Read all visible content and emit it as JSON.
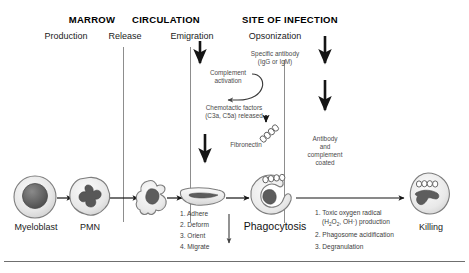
{
  "diagram": {
    "headers": [
      {
        "id": "marrow",
        "label": "MARROW"
      },
      {
        "id": "circulation",
        "label": "CIRCULATION"
      },
      {
        "id": "site",
        "label": "SITE OF INFECTION"
      }
    ],
    "stages": [
      {
        "id": "production",
        "label": "Production"
      },
      {
        "id": "release",
        "label": "Release"
      },
      {
        "id": "emigration",
        "label": "Emigration"
      },
      {
        "id": "opsonization",
        "label": "Opsonization"
      }
    ],
    "annotations": {
      "specific_antibody_line1": "Specific antibody",
      "specific_antibody_line2": "(IgG or IgM)",
      "complement_line1": "Complement",
      "complement_line2": "activation",
      "chemotactic_line1": "Chemotactic factors",
      "chemotactic_line2": "(C3a, C5a) released",
      "fibronectin": "Fibronectin",
      "coated_line1": "Antibody",
      "coated_line2": "and",
      "coated_line3": "complement",
      "coated_line4": "coated"
    },
    "cells": [
      {
        "id": "myeloblast",
        "label": "Myeloblast"
      },
      {
        "id": "pmn",
        "label": "PMN"
      },
      {
        "id": "migrating",
        "label": ""
      },
      {
        "id": "adherent",
        "label": ""
      },
      {
        "id": "phagocytosis",
        "label": "Phagocytosis"
      },
      {
        "id": "killing",
        "label": "Killing"
      }
    ],
    "migration_steps": [
      "1. Adhere",
      "2. Deform",
      "3. Orient",
      "4. Migrate"
    ],
    "killing_steps_line1": "1. Toxic oxygen radical",
    "killing_steps_line2_pre": "(H",
    "killing_steps_line2_sub1": "2",
    "killing_steps_line2_mid": "O",
    "killing_steps_line2_sub2": "2",
    "killing_steps_line2_post": ", OH·) production",
    "killing_steps_line3": "2. Phagosome acidification",
    "killing_steps_line4": "3. Degranulation",
    "colors": {
      "text": "#111111",
      "annotation": "#4b4b4b",
      "divider": "#8d8d8d",
      "arrow": "#151515",
      "cell_fill": "#e9e9e9",
      "nucleus": "#5c5c5c",
      "outline": "#6a6a6a"
    }
  }
}
